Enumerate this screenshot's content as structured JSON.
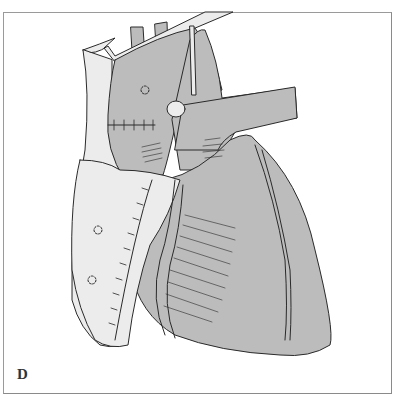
{
  "figure": {
    "panel_label": "D",
    "colors": {
      "background": "#ffffff",
      "frame_border": "#9a9a9a",
      "tissue_gray": "#bcbcbc",
      "tissue_light": "#ececec",
      "outline": "#2a2a2a"
    }
  }
}
